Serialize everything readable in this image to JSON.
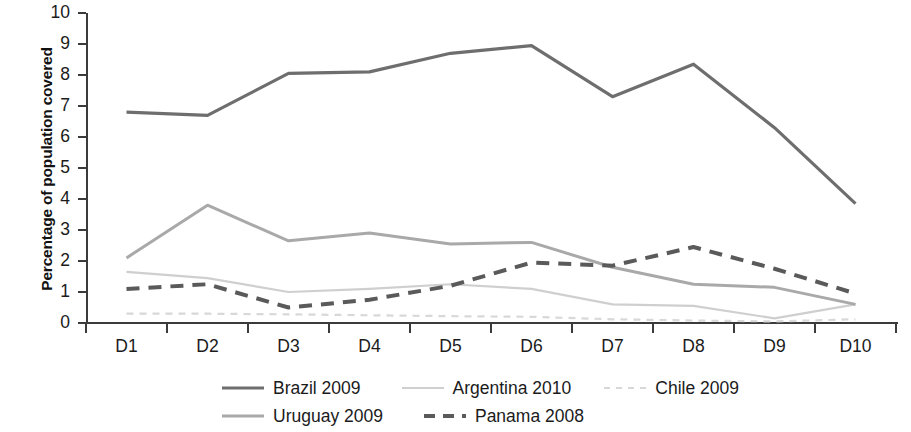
{
  "chart_data": {
    "type": "line",
    "title": "",
    "xlabel": "",
    "ylabel": "Percentage of population covered",
    "categories": [
      "D1",
      "D2",
      "D3",
      "D4",
      "D5",
      "D6",
      "D7",
      "D8",
      "D9",
      "D10"
    ],
    "ylim": [
      0,
      10
    ],
    "yticks": [
      "0",
      "1",
      "2",
      "3",
      "4",
      "5",
      "6",
      "7",
      "8",
      "9",
      "10"
    ],
    "grid": false,
    "legend_position": "bottom",
    "series": [
      {
        "name": "Brazil 2009",
        "color": "#6e6e6e",
        "style": "solid",
        "width": 3.2,
        "values": [
          6.8,
          6.7,
          8.05,
          8.1,
          8.7,
          8.95,
          7.3,
          8.35,
          6.3,
          3.85
        ]
      },
      {
        "name": "Uruguay 2009",
        "color": "#a9a9a9",
        "style": "solid",
        "width": 3.0,
        "values": [
          2.1,
          3.8,
          2.65,
          2.9,
          2.55,
          2.6,
          1.8,
          1.25,
          1.15,
          0.6
        ]
      },
      {
        "name": "Argentina 2010",
        "color": "#cfcfcf",
        "style": "solid",
        "width": 2.2,
        "values": [
          1.65,
          1.45,
          1.0,
          1.1,
          1.25,
          1.1,
          0.6,
          0.55,
          0.15,
          0.6
        ]
      },
      {
        "name": "Panama 2008",
        "color": "#5a5a5a",
        "style": "dashed",
        "width": 4.0,
        "values": [
          1.1,
          1.25,
          0.5,
          0.75,
          1.2,
          1.95,
          1.85,
          2.45,
          1.75,
          0.95
        ]
      },
      {
        "name": "Chile 2009",
        "color": "#d8d8d8",
        "style": "dashed",
        "width": 2.2,
        "values": [
          0.3,
          0.3,
          0.28,
          0.25,
          0.22,
          0.2,
          0.12,
          0.08,
          0.05,
          0.12
        ]
      }
    ]
  },
  "axis": {
    "y_title": "Percentage of population covered"
  },
  "legend": {
    "rows": [
      [
        {
          "label": "Brazil 2009",
          "key": "brazil"
        },
        {
          "label": "Argentina 2010",
          "key": "argentina"
        },
        {
          "label": "Chile 2009",
          "key": "chile"
        }
      ],
      [
        {
          "label": "Uruguay 2009",
          "key": "uruguay"
        },
        {
          "label": "Panama 2008",
          "key": "panama"
        }
      ]
    ]
  }
}
